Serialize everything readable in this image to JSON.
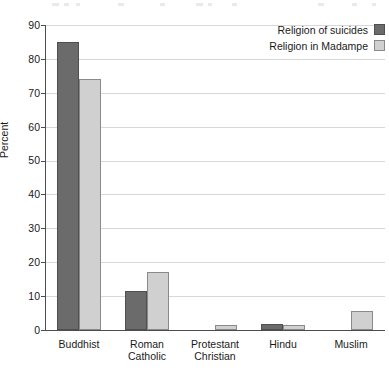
{
  "chart_data": {
    "type": "bar",
    "title": "",
    "subtitle": "",
    "xlabel": "",
    "ylabel": "Percent",
    "ylim": [
      0,
      90
    ],
    "yticks": [
      0,
      10,
      20,
      30,
      40,
      50,
      60,
      70,
      80,
      90
    ],
    "grid": true,
    "legend_position": "top-right",
    "categories": [
      "Buddhist",
      "Roman\nCatholic",
      "Protestant\nChristian",
      "Hindu",
      "Muslim"
    ],
    "series": [
      {
        "name": "Religion of suicides",
        "color": "#6b6b6b",
        "values": [
          85,
          11.5,
          0,
          1.8,
          0
        ]
      },
      {
        "name": "Religion in Madampe",
        "color": "#d0d0d0",
        "values": [
          74,
          17,
          1.5,
          1.5,
          5.5
        ]
      }
    ]
  },
  "legend": {
    "items": [
      {
        "label": "Religion of suicides",
        "swatch": "dark-gray-swatch"
      },
      {
        "label": "Religion in Madampe",
        "swatch": "light-gray-swatch"
      }
    ]
  },
  "axes": {
    "y_title": "Percent",
    "y_tick_labels": [
      "90",
      "80",
      "70",
      "60",
      "50",
      "40",
      "30",
      "20",
      "10",
      "0"
    ],
    "x_tick_labels": [
      "Buddhist",
      "Roman\nCatholic",
      "Protestant\nChristian",
      "Hindu",
      "Muslim"
    ]
  }
}
